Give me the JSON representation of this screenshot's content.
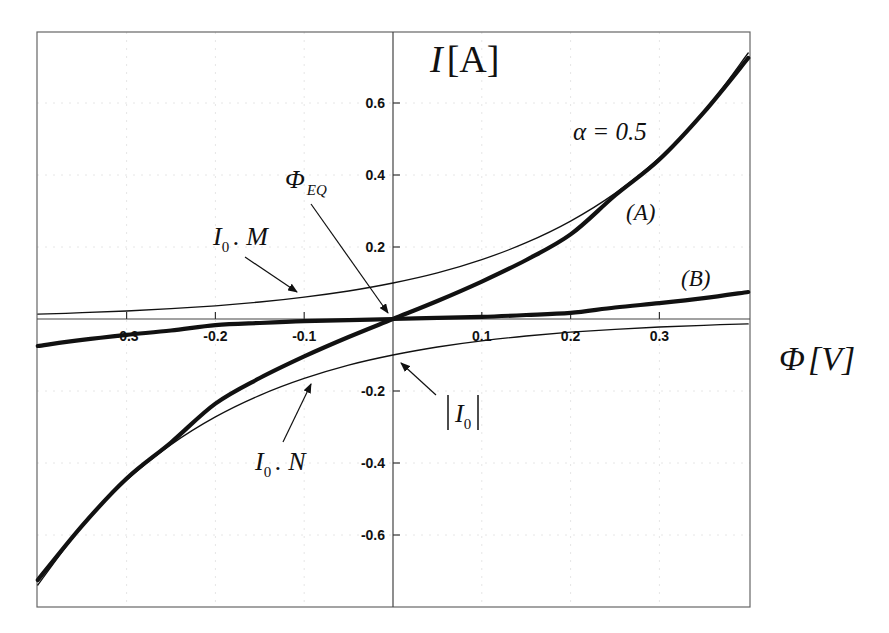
{
  "chart_data": {
    "type": "line",
    "title": "",
    "xlabel": "Φ[V]",
    "ylabel": "I[A]",
    "xlim": [
      -0.4,
      0.4
    ],
    "ylim": [
      -0.8,
      0.8
    ],
    "grid": true,
    "xticks": [
      -0.3,
      -0.2,
      -0.1,
      0.1,
      0.2,
      0.3
    ],
    "xtick_labels": [
      "-0.3",
      "-0.2",
      "-0.1",
      "0.1",
      "0.2",
      "0.3"
    ],
    "yticks": [
      0.6,
      0.4,
      0.2,
      -0.2,
      -0.4,
      -0.6
    ],
    "ytick_labels": [
      "0.6",
      "0.4",
      "0.2",
      "-0.2",
      "-0.4",
      "-0.6"
    ],
    "x": [
      -0.4,
      -0.35,
      -0.3,
      -0.25,
      -0.2,
      -0.15,
      -0.1,
      -0.05,
      0.0,
      0.05,
      0.1,
      0.15,
      0.2,
      0.25,
      0.3,
      0.35,
      0.4
    ],
    "series": [
      {
        "name": "(A)",
        "style": "thick",
        "values": [
          -0.725,
          -0.574,
          -0.443,
          -0.343,
          -0.235,
          -0.164,
          -0.104,
          -0.05,
          0.0,
          0.05,
          0.104,
          0.164,
          0.235,
          0.343,
          0.443,
          0.574,
          0.725
        ]
      },
      {
        "name": "(B)",
        "style": "thick",
        "values": [
          -0.075,
          -0.058,
          -0.044,
          -0.032,
          -0.017,
          -0.011,
          -0.006,
          -0.003,
          0.0,
          0.003,
          0.006,
          0.011,
          0.017,
          0.032,
          0.044,
          0.058,
          0.075
        ]
      },
      {
        "name": "I0 . M",
        "style": "thin",
        "values": [
          0.0135,
          0.0174,
          0.0223,
          0.0287,
          0.0368,
          0.0472,
          0.0607,
          0.0779,
          0.1,
          0.128,
          0.165,
          0.212,
          0.272,
          0.349,
          0.448,
          0.575,
          0.739
        ]
      },
      {
        "name": "|I0| . N",
        "style": "thin",
        "values": [
          -0.739,
          -0.575,
          -0.448,
          -0.349,
          -0.272,
          -0.212,
          -0.165,
          -0.128,
          -0.1,
          -0.0779,
          -0.0607,
          -0.0472,
          -0.0368,
          -0.0287,
          -0.0223,
          -0.0174,
          -0.0135
        ]
      }
    ],
    "annotations": [
      {
        "text": "α = 0.5",
        "x": 0.24,
        "y": 0.52
      },
      {
        "text": "Φ_EQ",
        "x": -0.05,
        "y": 0.39,
        "arrow_to": [
          0.0,
          0.0
        ]
      },
      {
        "text": "I0 . M",
        "x": -0.22,
        "y": 0.17,
        "arrow_to": [
          -0.1,
          0.075
        ]
      },
      {
        "text": "|I0|",
        "x": 0.05,
        "y": -0.28,
        "arrow_to": [
          0.005,
          -0.12
        ]
      },
      {
        "text": "I0 . N",
        "x": -0.14,
        "y": -0.4,
        "arrow_to": [
          -0.075,
          -0.17
        ]
      },
      {
        "text": "(A)",
        "x": 0.245,
        "y": 0.25
      },
      {
        "text": "(B)",
        "x": 0.3,
        "y": 0.1
      }
    ]
  },
  "labels": {
    "y_axis_main": "I",
    "y_axis_unit": "[A]",
    "x_axis_main": "Φ",
    "x_axis_unit": "[V]",
    "alpha": "α = 0.5",
    "phi_eq_main": "Φ",
    "phi_eq_sub": "EQ",
    "curve_a": "(A)",
    "curve_b": "(B)",
    "i0": "I",
    "i0_sub": "0",
    "dot_m": ". M",
    "dot_n": ". N"
  },
  "colors": {
    "curve": "#111111",
    "frame": "#555555",
    "grid": "#e6e6e6"
  }
}
